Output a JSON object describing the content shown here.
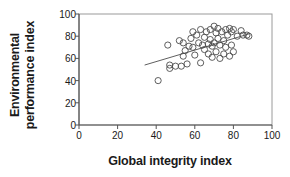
{
  "chart_data": {
    "type": "scatter",
    "title": "",
    "xlabel": "Global integrity index",
    "ylabel": "Environmental performance index",
    "ylabel_lines": [
      "Environmental",
      "performance index"
    ],
    "xlim": [
      0,
      100
    ],
    "ylim": [
      0,
      100
    ],
    "xticks": [
      0,
      20,
      40,
      60,
      80,
      100
    ],
    "yticks": [
      0,
      20,
      40,
      60,
      80,
      100
    ],
    "grid": false,
    "legend": null,
    "marker": "open-circle",
    "marker_color": "#4d4d4d",
    "points": [
      {
        "x": 41,
        "y": 40
      },
      {
        "x": 46,
        "y": 72
      },
      {
        "x": 47,
        "y": 51
      },
      {
        "x": 47,
        "y": 54
      },
      {
        "x": 50,
        "y": 53
      },
      {
        "x": 52,
        "y": 76
      },
      {
        "x": 53,
        "y": 53
      },
      {
        "x": 54,
        "y": 62
      },
      {
        "x": 54,
        "y": 74
      },
      {
        "x": 55,
        "y": 67
      },
      {
        "x": 56,
        "y": 55
      },
      {
        "x": 57,
        "y": 71
      },
      {
        "x": 58,
        "y": 78
      },
      {
        "x": 59,
        "y": 70
      },
      {
        "x": 59,
        "y": 84
      },
      {
        "x": 60,
        "y": 63
      },
      {
        "x": 61,
        "y": 81
      },
      {
        "x": 62,
        "y": 74
      },
      {
        "x": 63,
        "y": 56
      },
      {
        "x": 63,
        "y": 86
      },
      {
        "x": 64,
        "y": 72
      },
      {
        "x": 65,
        "y": 79
      },
      {
        "x": 65,
        "y": 68
      },
      {
        "x": 66,
        "y": 84
      },
      {
        "x": 67,
        "y": 73
      },
      {
        "x": 67,
        "y": 64
      },
      {
        "x": 68,
        "y": 77
      },
      {
        "x": 68,
        "y": 86
      },
      {
        "x": 69,
        "y": 71
      },
      {
        "x": 69,
        "y": 61
      },
      {
        "x": 70,
        "y": 74
      },
      {
        "x": 70,
        "y": 89
      },
      {
        "x": 71,
        "y": 83
      },
      {
        "x": 71,
        "y": 66
      },
      {
        "x": 72,
        "y": 78
      },
      {
        "x": 72,
        "y": 87
      },
      {
        "x": 73,
        "y": 72
      },
      {
        "x": 73,
        "y": 60
      },
      {
        "x": 74,
        "y": 84
      },
      {
        "x": 75,
        "y": 76
      },
      {
        "x": 75,
        "y": 64
      },
      {
        "x": 76,
        "y": 86
      },
      {
        "x": 76,
        "y": 70
      },
      {
        "x": 77,
        "y": 81
      },
      {
        "x": 78,
        "y": 62
      },
      {
        "x": 78,
        "y": 87
      },
      {
        "x": 79,
        "y": 84
      },
      {
        "x": 79,
        "y": 72
      },
      {
        "x": 80,
        "y": 66
      },
      {
        "x": 80,
        "y": 86
      },
      {
        "x": 82,
        "y": 80
      },
      {
        "x": 84,
        "y": 85
      },
      {
        "x": 85,
        "y": 81
      },
      {
        "x": 87,
        "y": 81
      },
      {
        "x": 88,
        "y": 80
      }
    ],
    "trendline": {
      "x_start": 34,
      "y_start": 54,
      "x_end": 88,
      "y_end": 82,
      "color": "#4d4d4d"
    }
  }
}
